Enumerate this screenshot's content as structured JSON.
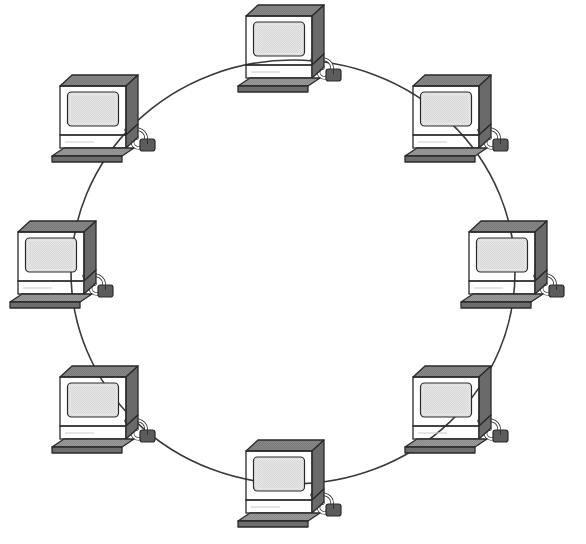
{
  "diagram": {
    "type": "ring-network-topology",
    "title": "",
    "background_color": "#ffffff",
    "node_count": 8,
    "node_label": "computer-workstation",
    "connection": {
      "shape": "circle",
      "stroke_color": "#3a3a3a",
      "stroke_width": 1.6,
      "center_x": 293,
      "center_y": 272,
      "radius_x": 222,
      "radius_y": 212
    },
    "palette": {
      "screen": "#d8d8d8",
      "screen_highlight": "#e6e6e6",
      "case_front": "#8d8d8d",
      "case_top": "#7a7a7a",
      "case_side": "#6a6a6a",
      "bezel": "#9a9a9a",
      "keyboard_top": "#8a8a8a",
      "keyboard_side": "#6e6e6e",
      "mouse": "#5c5c5c",
      "outline": "#2a2a2a",
      "cord": "#ffffff",
      "cord_outline": "#2a2a2a"
    },
    "nodes": [
      {
        "id": "node-1",
        "position": "top",
        "angle_deg": 270,
        "x": 234,
        "y": 2
      },
      {
        "id": "node-2",
        "position": "top-right",
        "angle_deg": 315,
        "x": 401,
        "y": 72
      },
      {
        "id": "node-3",
        "position": "right",
        "angle_deg": 0,
        "x": 457,
        "y": 218
      },
      {
        "id": "node-4",
        "position": "bottom-right",
        "angle_deg": 45,
        "x": 401,
        "y": 363
      },
      {
        "id": "node-5",
        "position": "bottom",
        "angle_deg": 90,
        "x": 234,
        "y": 437
      },
      {
        "id": "node-6",
        "position": "bottom-left",
        "angle_deg": 135,
        "x": 48,
        "y": 363
      },
      {
        "id": "node-7",
        "position": "left",
        "angle_deg": 180,
        "x": 6,
        "y": 218
      },
      {
        "id": "node-8",
        "position": "top-left",
        "angle_deg": 225,
        "x": 48,
        "y": 72
      }
    ]
  }
}
